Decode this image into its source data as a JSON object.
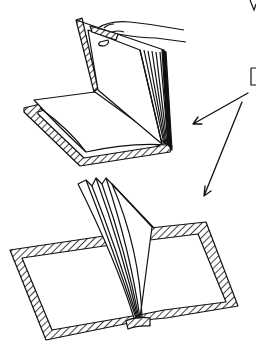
{
  "illustration": {
    "labels": {
      "top_right_partial": "V",
      "right_partial": "D"
    },
    "figures": [
      {
        "name": "book-being-opened-by-hand"
      },
      {
        "name": "open-book-with-fanned-pages"
      }
    ],
    "arrows": [
      {
        "from": [
          248,
          93
        ],
        "to": [
          193,
          124
        ]
      },
      {
        "from": [
          242,
          102
        ],
        "to": [
          204,
          196
        ]
      }
    ],
    "colors": {
      "ink": "#111111",
      "paper": "#ffffff"
    }
  }
}
